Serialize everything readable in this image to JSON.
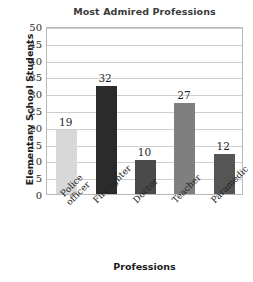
{
  "chart_data": {
    "type": "bar",
    "title": "Most Admired Professions",
    "xlabel": "Professions",
    "ylabel": "Elementary School Students",
    "categories": [
      "Police officer",
      "Firefighter",
      "Doctor",
      "Teacher",
      "Paramedic"
    ],
    "values": [
      19,
      32,
      10,
      27,
      12
    ],
    "value_labels": [
      "19",
      "32",
      "10",
      "27",
      "12"
    ],
    "bar_colors": [
      "#d8d8d8",
      "#2b2b2b",
      "#4a4a4a",
      "#7f7f7f",
      "#555555"
    ],
    "ylim": [
      0,
      50
    ],
    "ytick_step": 5,
    "ytick_labels": [
      "50",
      "45",
      "40",
      "35",
      "30",
      "25",
      "20",
      "15",
      "10",
      "5",
      "0"
    ],
    "grid": true,
    "legend": "none",
    "category_label_rotation": -45,
    "category_label_lines": [
      [
        "Police",
        "officer"
      ],
      [
        "Firefighter"
      ],
      [
        "Doctor"
      ],
      [
        "Teacher"
      ],
      [
        "Paramedic"
      ]
    ]
  },
  "colors": {
    "frame": "#b9b9b9",
    "gridline": "#cfcfcf",
    "title_text": "#3a3a3a",
    "axis_text": "#1c1c1c"
  }
}
